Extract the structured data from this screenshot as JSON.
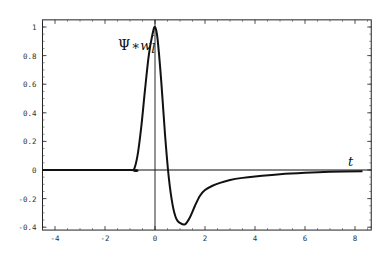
{
  "chart_data": {
    "type": "line",
    "title": "",
    "xlabel": "t",
    "ylabel": "",
    "xlim": [
      -4.5,
      8.65
    ],
    "ylim": [
      -0.42,
      1.05
    ],
    "grid": false,
    "legend": null,
    "x_ticks": [
      -4,
      -2,
      0,
      2,
      4,
      6,
      8
    ],
    "x_tick_labels": [
      "-4",
      "-2",
      "0",
      "2",
      "4",
      "6",
      "8"
    ],
    "y_ticks": [
      -0.4,
      -0.2,
      0,
      0.2,
      0.4,
      0.6,
      0.8,
      1
    ],
    "y_tick_labels": [
      "-0.4",
      "-0.2",
      "0",
      "0.2",
      "0.4",
      "0.6",
      "0.8",
      "1"
    ],
    "annotations": [
      {
        "text": "Ψ∗w′ᵢ",
        "x": -0.2,
        "y": 0.9,
        "label_parts": {
          "psi": "Ψ",
          "op": "∗",
          "w": "w",
          "prime": "′",
          "sub": "l"
        }
      },
      {
        "text": "t",
        "x": 8.0,
        "y": 0.03
      }
    ],
    "series": [
      {
        "name": "Psi*w'_l",
        "x": [
          -4.5,
          -1.0,
          -0.85,
          -0.7,
          -0.55,
          -0.4,
          -0.25,
          -0.1,
          0.0,
          0.1,
          0.25,
          0.4,
          0.55,
          0.7,
          0.85,
          1.0,
          1.2,
          1.4,
          1.6,
          1.8,
          2.0,
          2.3,
          2.6,
          3.0,
          3.5,
          4.0,
          5.0,
          6.0,
          7.0,
          8.3
        ],
        "y": [
          0.0,
          0.0,
          0.0,
          0.1,
          0.3,
          0.56,
          0.8,
          0.95,
          1.0,
          0.92,
          0.62,
          0.25,
          -0.05,
          -0.24,
          -0.34,
          -0.37,
          -0.38,
          -0.33,
          -0.25,
          -0.18,
          -0.14,
          -0.11,
          -0.09,
          -0.07,
          -0.055,
          -0.045,
          -0.03,
          -0.02,
          -0.013,
          -0.008
        ]
      }
    ]
  },
  "labels": {
    "annotation_psi": "Ψ",
    "annotation_op": "∗",
    "annotation_w": "w",
    "annotation_prime": "′",
    "annotation_sub": "l",
    "axis_t": "t"
  }
}
